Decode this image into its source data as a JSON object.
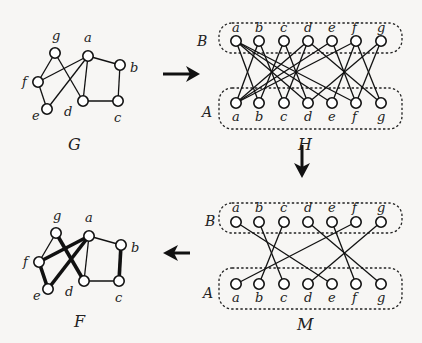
{
  "graphs": {
    "G": {
      "label": "G"
    },
    "H": {
      "label": "H",
      "side_top": "B",
      "side_bottom": "A"
    },
    "M": {
      "label": "M",
      "side_top": "B",
      "side_bottom": "A"
    },
    "F": {
      "label": "F"
    }
  },
  "vertices": [
    "a",
    "b",
    "c",
    "d",
    "e",
    "f",
    "g"
  ],
  "g_edges": [
    [
      "g",
      "f"
    ],
    [
      "g",
      "d"
    ],
    [
      "a",
      "f"
    ],
    [
      "a",
      "e"
    ],
    [
      "a",
      "d"
    ],
    [
      "a",
      "b"
    ],
    [
      "b",
      "c"
    ],
    [
      "c",
      "d"
    ],
    [
      "f",
      "e"
    ]
  ],
  "m_matching": [
    [
      "a",
      "e"
    ],
    [
      "b",
      "c"
    ],
    [
      "c",
      "b"
    ],
    [
      "d",
      "g"
    ],
    [
      "e",
      "f"
    ],
    [
      "f",
      "a"
    ],
    [
      "g",
      "d"
    ]
  ],
  "f_bold_edges": [
    [
      "f",
      "e"
    ],
    [
      "e",
      "a"
    ],
    [
      "a",
      "f"
    ],
    [
      "g",
      "d"
    ],
    [
      "b",
      "c"
    ]
  ],
  "f_thin_edges": [
    [
      "g",
      "f"
    ],
    [
      "a",
      "d"
    ],
    [
      "a",
      "b"
    ],
    [
      "c",
      "d"
    ]
  ],
  "arrows": [
    "right",
    "down",
    "left"
  ]
}
